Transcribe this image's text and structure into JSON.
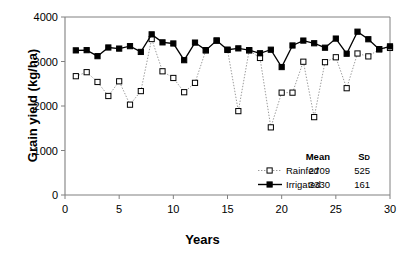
{
  "chart_data": {
    "type": "line",
    "title": "",
    "xlabel": "Years",
    "ylabel": "Grain yield (kg/ha)",
    "xlim": [
      0,
      30
    ],
    "ylim": [
      0,
      4000
    ],
    "xticks": [
      0,
      5,
      10,
      15,
      20,
      25,
      30
    ],
    "yticks": [
      0,
      1000,
      2000,
      3000,
      4000
    ],
    "grid": false,
    "legend_position": "inside-bottom-right",
    "x": [
      1,
      2,
      3,
      4,
      5,
      6,
      7,
      8,
      9,
      10,
      11,
      12,
      13,
      14,
      15,
      16,
      17,
      18,
      19,
      20,
      21,
      22,
      23,
      24,
      25,
      26,
      27,
      28,
      29,
      30
    ],
    "series": [
      {
        "name": "Rainfed",
        "marker": "open-square",
        "line": "dotted",
        "mean": 2709,
        "sd": 525,
        "values": [
          2670,
          2760,
          2540,
          2225,
          2555,
          2030,
          2335,
          3505,
          2780,
          2630,
          2310,
          2520,
          3250,
          3470,
          3260,
          1885,
          3250,
          3080,
          1520,
          2300,
          2300,
          2995,
          1750,
          2985,
          3095,
          2400,
          3180,
          3115,
          3275,
          3305
        ]
      },
      {
        "name": "Irrigated",
        "marker": "filled-square",
        "line": "solid",
        "mean": 3330,
        "sd": 161,
        "values": [
          3250,
          3255,
          3120,
          3315,
          3290,
          3345,
          3215,
          3610,
          3430,
          3405,
          3030,
          3425,
          3255,
          3470,
          3265,
          3295,
          3255,
          3185,
          3265,
          2875,
          3360,
          3470,
          3410,
          3310,
          3515,
          3175,
          3670,
          3500,
          3275,
          3340
        ]
      }
    ],
    "legend": {
      "columns": [
        "Mean",
        "SD"
      ],
      "rows": [
        {
          "label": "Rainfed",
          "mean": "2709",
          "sd": "525"
        },
        {
          "label": "Irrigated",
          "mean": "3330",
          "sd": "161"
        }
      ],
      "sd_caps": {
        "big": "S",
        "small": "D"
      }
    },
    "colors": {
      "axis": "#808080",
      "irrigated_line": "#000000",
      "rainfed_line": "#9a9a9a",
      "marker_fill_irrigated": "#000000",
      "marker_fill_rainfed": "#ffffff",
      "marker_stroke": "#000000"
    }
  }
}
